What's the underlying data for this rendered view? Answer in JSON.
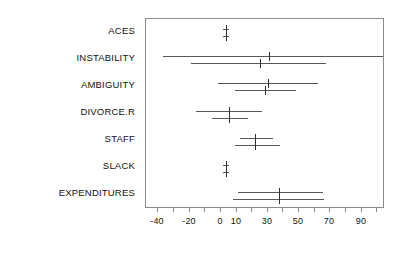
{
  "chart_data": {
    "type": "bar",
    "subtype": "forest-plot-confidence-intervals",
    "title": "",
    "xlabel": "",
    "ylabel": "",
    "xlim": [
      -48,
      105
    ],
    "grid": false,
    "legend": false,
    "axis": {
      "tick_values": [
        -40,
        -30,
        -20,
        -10,
        0,
        10,
        20,
        30,
        40,
        50,
        60,
        70,
        80,
        90,
        100
      ],
      "tick_labels": [
        "-40",
        "",
        "-20",
        "",
        "0",
        "10",
        "",
        "30",
        "",
        "50",
        "",
        "70",
        "",
        "90",
        ""
      ],
      "labeled_ticks": [
        {
          "value": -40,
          "label": "-40"
        },
        {
          "value": -20,
          "label": "-20"
        },
        {
          "value": 0,
          "label": "0"
        },
        {
          "value": 10,
          "label": "10"
        },
        {
          "value": 30,
          "label": "30"
        },
        {
          "value": 50,
          "label": "50"
        },
        {
          "value": 70,
          "label": "70"
        },
        {
          "value": 90,
          "label": "90"
        }
      ]
    },
    "categories": [
      "ACES",
      "INSTABILITY",
      "AMBIGUITY",
      "DIVORCE.R",
      "STAFF",
      "SLACK",
      "EXPENDITURES"
    ],
    "series": [
      {
        "name": "interval-upper",
        "estimates": [
          3,
          31,
          30,
          5,
          22,
          3,
          37
        ],
        "lower": [
          1,
          -37,
          -2,
          -16,
          12,
          1,
          11
        ],
        "upper": [
          5,
          104,
          62,
          26,
          33,
          5,
          65
        ]
      },
      {
        "name": "interval-lower",
        "estimates": [
          3,
          25,
          28,
          5,
          22,
          3,
          37
        ],
        "lower": [
          1,
          -19,
          9,
          -6,
          9,
          1,
          8
        ],
        "upper": [
          5,
          67,
          48,
          17,
          38,
          5,
          66
        ]
      }
    ],
    "rows": [
      {
        "category": "ACES",
        "intervals": [
          {
            "lower": 1,
            "estimate": 3,
            "upper": 5
          },
          {
            "lower": 1,
            "estimate": 3,
            "upper": 5
          }
        ]
      },
      {
        "category": "INSTABILITY",
        "intervals": [
          {
            "lower": -37,
            "estimate": 31,
            "upper": 104
          },
          {
            "lower": -19,
            "estimate": 25,
            "upper": 67
          }
        ]
      },
      {
        "category": "AMBIGUITY",
        "intervals": [
          {
            "lower": -2,
            "estimate": 30,
            "upper": 62
          },
          {
            "lower": 9,
            "estimate": 28,
            "upper": 48
          }
        ]
      },
      {
        "category": "DIVORCE.R",
        "intervals": [
          {
            "lower": -16,
            "estimate": 5,
            "upper": 26
          },
          {
            "lower": -6,
            "estimate": 5,
            "upper": 17
          }
        ]
      },
      {
        "category": "STAFF",
        "intervals": [
          {
            "lower": 12,
            "estimate": 22,
            "upper": 33
          },
          {
            "lower": 9,
            "estimate": 22,
            "upper": 38
          }
        ]
      },
      {
        "category": "SLACK",
        "intervals": [
          {
            "lower": 1,
            "estimate": 3,
            "upper": 5
          },
          {
            "lower": 1,
            "estimate": 3,
            "upper": 5
          }
        ]
      },
      {
        "category": "EXPENDITURES",
        "intervals": [
          {
            "lower": 11,
            "estimate": 37,
            "upper": 65
          },
          {
            "lower": 8,
            "estimate": 37,
            "upper": 66
          }
        ]
      }
    ]
  },
  "style": {
    "line_color": "#55585c",
    "marker_color": "#2e3134",
    "frame_color": "#8a8a8a",
    "text_color": "#111111",
    "background": "#ffffff"
  }
}
